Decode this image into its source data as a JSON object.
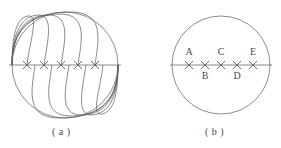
{
  "figure": {
    "type": "geometry-diagram",
    "background_color": "#ffffff",
    "stroke_color": "#5a5a5a",
    "stroke_width": 0.7,
    "panels": [
      {
        "id": "panel-a",
        "caption": "( a )",
        "circle": {
          "cx": 65,
          "cy": 65,
          "r": 53
        },
        "diameter_line": {
          "x1": 9,
          "y1": 65,
          "x2": 121,
          "y2": 65
        },
        "marks": [
          {
            "label": "",
            "x": 27,
            "y": 65,
            "glyph": "x-mark"
          },
          {
            "label": "",
            "x": 44,
            "y": 65,
            "glyph": "x-mark"
          },
          {
            "label": "",
            "x": 61,
            "y": 65,
            "glyph": "x-mark"
          },
          {
            "label": "",
            "x": 78,
            "y": 65,
            "glyph": "x-mark"
          },
          {
            "label": "",
            "x": 95,
            "y": 65,
            "glyph": "x-mark"
          }
        ],
        "arcs_upper_count": 5,
        "arcs_lower_count": 5,
        "arc_origin": {
          "x": 12,
          "y": 65
        },
        "arc_terminus": {
          "x": 118,
          "y": 65
        }
      },
      {
        "id": "panel-b",
        "caption": "( b )",
        "circle": {
          "cx": 221,
          "cy": 65,
          "r": 49
        },
        "diameter_line": {
          "x1": 170,
          "y1": 65,
          "x2": 272,
          "y2": 65
        },
        "marks": [
          {
            "label": "A",
            "x": 189,
            "y": 65,
            "glyph": "x-mark",
            "label_side": "above"
          },
          {
            "label": "B",
            "x": 205,
            "y": 65,
            "glyph": "x-mark",
            "label_side": "below"
          },
          {
            "label": "C",
            "x": 221,
            "y": 65,
            "glyph": "x-mark",
            "label_side": "above"
          },
          {
            "label": "D",
            "x": 237,
            "y": 65,
            "glyph": "x-mark",
            "label_side": "below"
          },
          {
            "label": "E",
            "x": 253,
            "y": 65,
            "glyph": "x-mark",
            "label_side": "above"
          }
        ]
      }
    ]
  }
}
